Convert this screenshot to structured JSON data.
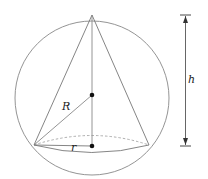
{
  "diagram": {
    "labels": {
      "R": "R",
      "r": "r",
      "h": "h"
    },
    "colors": {
      "stroke": "#777777",
      "dot": "#111111",
      "text": "#222222"
    }
  }
}
